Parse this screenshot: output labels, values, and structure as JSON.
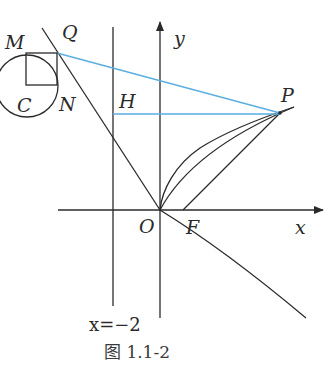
{
  "figure": {
    "caption": "图 1.1-2",
    "directrix_label": "x=−2",
    "colors": {
      "line": "#2a2a2a",
      "accent": "#5aaee0"
    },
    "points": {
      "M": "M",
      "Q": "Q",
      "C": "C",
      "N": "N",
      "H": "H",
      "P": "P",
      "O": "O",
      "F": "F"
    },
    "axes": {
      "x": "x",
      "y": "y"
    }
  }
}
